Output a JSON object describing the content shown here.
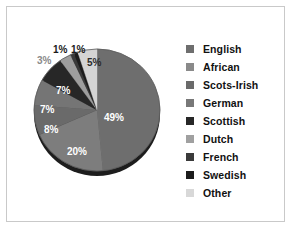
{
  "chart_data": {
    "type": "pie",
    "title": "",
    "categories": [
      "English",
      "African",
      "Scots-Irish",
      "German",
      "Scottish",
      "Dutch",
      "French",
      "Swedish",
      "Other"
    ],
    "values": [
      49,
      20,
      8,
      7,
      7,
      3,
      1,
      1,
      5
    ],
    "value_labels": [
      "49%",
      "20%",
      "8%",
      "7%",
      "7%",
      "3%",
      "1%",
      "1%",
      "5%"
    ],
    "colors": [
      "#6e6e6e",
      "#7d7d7d",
      "#6a6a6a",
      "#757575",
      "#272727",
      "#9e9e9e",
      "#3a3a3a",
      "#1c1c1c",
      "#d4d4d4"
    ],
    "label_text_colors": [
      "#ffffff",
      "#ffffff",
      "#ffffff",
      "#ffffff",
      "#ffffff",
      "#8a8a8a",
      "#1a1a1a",
      "#1a1a1a",
      "#2b2b2b"
    ],
    "start_angle_deg": 0,
    "direction": "clockwise",
    "legend_position": "right",
    "grid": false,
    "xlabel": "",
    "ylabel": ""
  },
  "legend": {
    "entries": [
      {
        "label": "English",
        "color": "#6e6e6e"
      },
      {
        "label": "African",
        "color": "#8a8a8a"
      },
      {
        "label": "Scots-Irish",
        "color": "#6a6a6a"
      },
      {
        "label": "German",
        "color": "#787878"
      },
      {
        "label": "Scottish",
        "color": "#272727"
      },
      {
        "label": "Dutch",
        "color": "#a0a0a0"
      },
      {
        "label": "French",
        "color": "#3a3a3a"
      },
      {
        "label": "Swedish",
        "color": "#1c1c1c"
      },
      {
        "label": "Other",
        "color": "#d8d8d8"
      }
    ]
  },
  "slice_labels": [
    {
      "text": "49%",
      "left": 104,
      "top": 113,
      "style": "on-dark"
    },
    {
      "text": "20%",
      "left": 67,
      "top": 147,
      "style": "on-dark"
    },
    {
      "text": "8%",
      "left": 44,
      "top": 125,
      "style": "on-dark"
    },
    {
      "text": "7%",
      "left": 40,
      "top": 105,
      "style": "on-dark"
    },
    {
      "text": "7%",
      "left": 56,
      "top": 86,
      "style": "on-dark"
    },
    {
      "text": "3%",
      "left": 37,
      "top": 56,
      "style": "outside-gray"
    },
    {
      "text": "1%",
      "left": 53,
      "top": 45,
      "style": "outside-dark"
    },
    {
      "text": "1%",
      "left": 71,
      "top": 45,
      "style": "outside-dark"
    },
    {
      "text": "5%",
      "left": 87,
      "top": 58,
      "style": "on-light"
    }
  ]
}
